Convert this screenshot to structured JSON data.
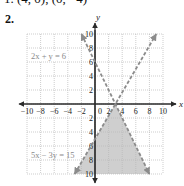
{
  "header": {
    "prev_answer": "1.  (4, 0), (0, −4)",
    "problem_number": "2."
  },
  "colors": {
    "axis": "#2a2a2a",
    "grid": "#b8b8b8",
    "boundary_line": "#8c8c8c",
    "shading": "#cfcfcf",
    "label_text": "#8a8a8a"
  },
  "chart_data": {
    "type": "line",
    "title": "",
    "xlabel": "x",
    "ylabel": "y",
    "xlim": [
      -10,
      10
    ],
    "ylim": [
      -10,
      10
    ],
    "grid": true,
    "grid_step": 2,
    "x_ticks": [
      -10,
      -8,
      -6,
      -4,
      -2,
      2,
      4,
      6,
      8,
      10
    ],
    "x_tick_labels": [
      "−10",
      "−8",
      "−6",
      "−4",
      "−2",
      "2",
      "4",
      "6",
      "8",
      "10"
    ],
    "y_ticks": [
      10,
      8,
      6,
      4,
      2,
      -2,
      -4,
      -6,
      -8,
      -10
    ],
    "y_tick_labels": [
      "10",
      "8",
      "6",
      "4",
      "2",
      "2",
      "4",
      "6",
      "8",
      "10"
    ],
    "origin_label": "0",
    "series": [
      {
        "name": "2x + y = 6",
        "style": "dashed",
        "points": [
          [
            -2,
            10
          ],
          [
            8,
            -10
          ]
        ]
      },
      {
        "name": "5x − 3y = 15",
        "style": "dashed",
        "points": [
          [
            -3,
            -10
          ],
          [
            9,
            10
          ]
        ]
      }
    ],
    "shaded_region": {
      "description": "2x + y < 6 and 5x − 3y > 15",
      "vertices": [
        [
          3,
          0
        ],
        [
          -3,
          -10
        ],
        [
          8,
          -10
        ]
      ]
    },
    "annotations": [
      {
        "text": "2x + y = 6",
        "boxed": true
      },
      {
        "text": "5x − 3y = 15",
        "boxed": false
      }
    ]
  }
}
